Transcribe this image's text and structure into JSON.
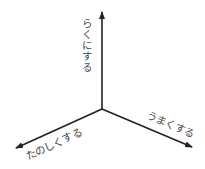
{
  "diagram": {
    "type": "three-axis",
    "axes": [
      {
        "id": "up",
        "label": "らくにする",
        "direction": "up"
      },
      {
        "id": "left",
        "label": "たのしくする",
        "direction": "lower-left"
      },
      {
        "id": "right",
        "label": "うまくする",
        "direction": "lower-right"
      }
    ],
    "colors": {
      "line": "#222222",
      "text": "#444444"
    }
  }
}
